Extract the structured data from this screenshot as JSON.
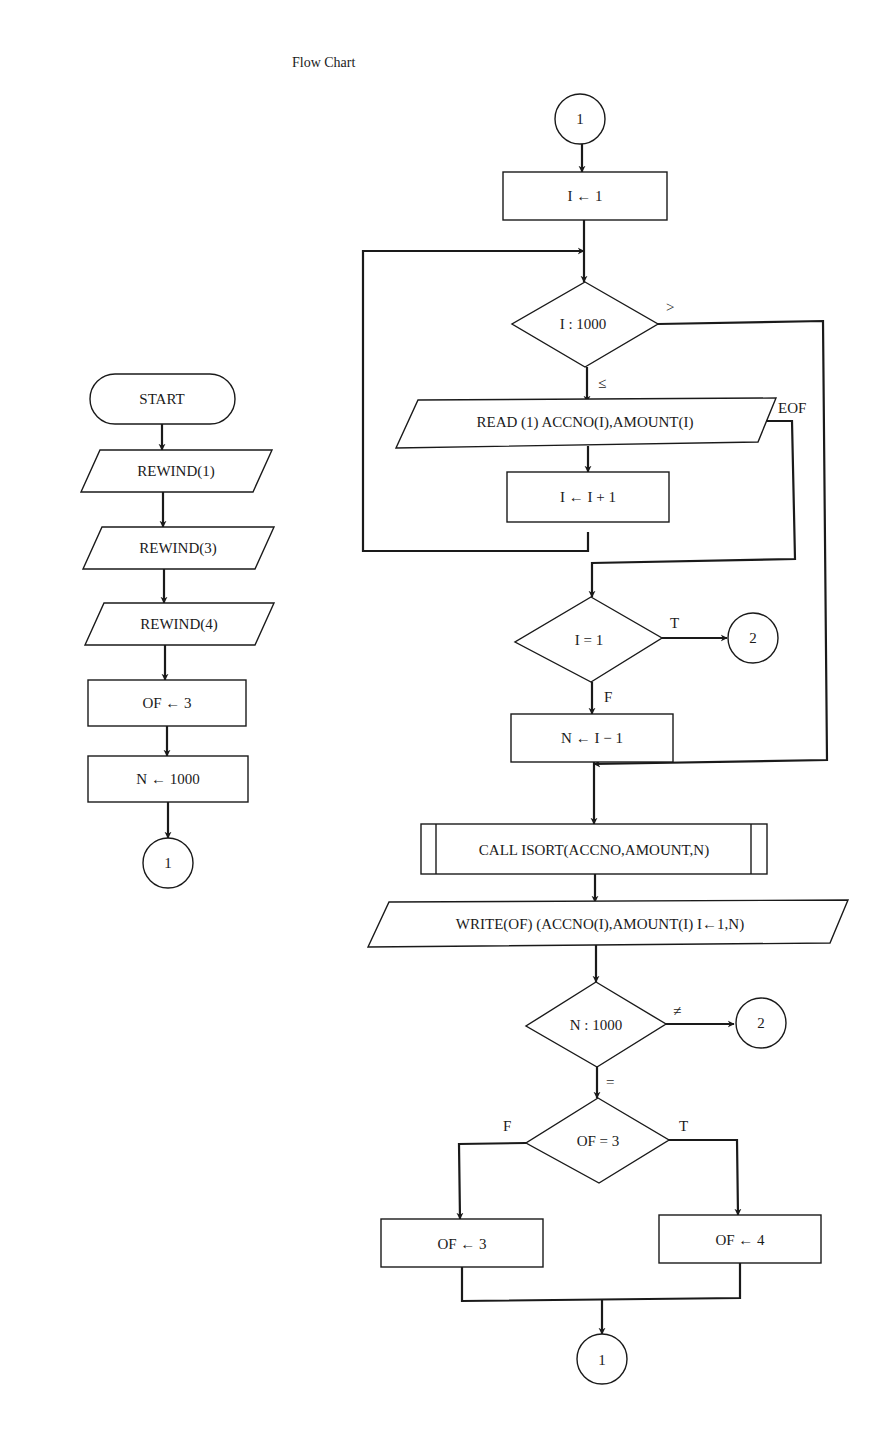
{
  "title": "Flow Chart",
  "left_chart": {
    "start": "START",
    "rewind1": "REWIND(1)",
    "rewind3": "REWIND(3)",
    "rewind4": "REWIND(4)",
    "of_init": "OF ← 3",
    "n_init": "N ← 1000",
    "connector_out": "1"
  },
  "right_chart": {
    "connector_in": "1",
    "i_init": "I ← 1",
    "loop_test": "I : 1000",
    "loop_test_gt": ">",
    "loop_test_le": "≤",
    "read": "READ (1) ACCNO(I),AMOUNT(I)",
    "read_eof": "EOF",
    "increment": "I ← I + 1",
    "empty_test": "I = 1",
    "empty_test_true": "T",
    "empty_test_false": "F",
    "connector_2a": "2",
    "n_set": "N ← I − 1",
    "call_sort": "CALL ISORT(ACCNO,AMOUNT,N)",
    "write": "WRITE(OF) (ACCNO(I),AMOUNT(I) I←1,N)",
    "n_test": "N : 1000",
    "n_test_ne": "≠",
    "n_test_eq": "=",
    "connector_2b": "2",
    "of_test": "OF = 3",
    "of_test_false": "F",
    "of_test_true": "T",
    "of_set3": "OF ← 3",
    "of_set4": "OF ← 4",
    "connector_end": "1"
  },
  "colors": {
    "ink": "#1a1a1a",
    "paper": "#ffffff"
  }
}
